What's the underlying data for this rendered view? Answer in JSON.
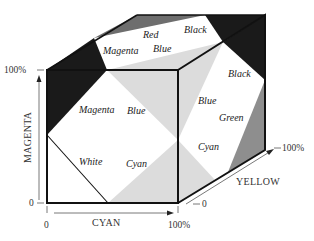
{
  "diagram": {
    "type": "cmy-color-cube",
    "colors": {
      "black": "#1a1a1a",
      "dark_gray": "#6e6e6e",
      "mid_gray": "#9a9a9a",
      "light_gray": "#dcdcdc",
      "white": "#ffffff",
      "edge": "#111111"
    },
    "axes": {
      "magenta": {
        "label": "MAGENTA",
        "min_tick": "0",
        "max_tick": "100%"
      },
      "cyan": {
        "label": "CYAN",
        "min_tick": "0",
        "max_tick": "100%"
      },
      "yellow": {
        "label": "YELLOW",
        "min_tick": "0",
        "max_tick": "100%"
      }
    },
    "faces": {
      "top": {
        "labels": [
          "Red",
          "Black",
          "Magenta",
          "Blue"
        ]
      },
      "front": {
        "labels": [
          "Magenta",
          "Blue",
          "White",
          "Cyan"
        ]
      },
      "side": {
        "labels": [
          "Black",
          "Blue",
          "Green",
          "Cyan"
        ]
      }
    }
  }
}
